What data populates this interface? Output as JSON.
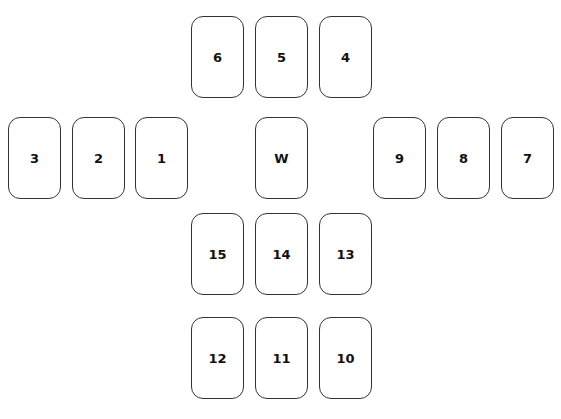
{
  "layout": {
    "cards": [
      {
        "label": "6",
        "x": 191,
        "y": 16
      },
      {
        "label": "5",
        "x": 255,
        "y": 16
      },
      {
        "label": "4",
        "x": 319,
        "y": 16
      },
      {
        "label": "3",
        "x": 8,
        "y": 117
      },
      {
        "label": "2",
        "x": 72,
        "y": 117
      },
      {
        "label": "1",
        "x": 135,
        "y": 117
      },
      {
        "label": "W",
        "x": 255,
        "y": 117
      },
      {
        "label": "9",
        "x": 373,
        "y": 117
      },
      {
        "label": "8",
        "x": 437,
        "y": 117
      },
      {
        "label": "7",
        "x": 501,
        "y": 117
      },
      {
        "label": "15",
        "x": 191,
        "y": 213
      },
      {
        "label": "14",
        "x": 255,
        "y": 213
      },
      {
        "label": "13",
        "x": 319,
        "y": 213
      },
      {
        "label": "12",
        "x": 191,
        "y": 317
      },
      {
        "label": "11",
        "x": 255,
        "y": 317
      },
      {
        "label": "10",
        "x": 319,
        "y": 317
      }
    ]
  }
}
